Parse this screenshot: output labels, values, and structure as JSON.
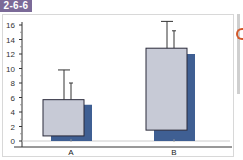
{
  "figure_label": "2-6-6",
  "colors": {
    "label_bg": "#7b6a98",
    "box_fill": "#c7cad6",
    "box_stroke": "#2a2a3a",
    "shadow_fill": "#3f5f93",
    "axis": "#333333",
    "baseline": "#cccccc",
    "side_glyph": "#d2582a"
  },
  "chart_data": {
    "type": "bar",
    "title": "",
    "xlabel": "",
    "ylabel": "",
    "categories": [
      "A",
      "B"
    ],
    "ylim": [
      0,
      16
    ],
    "yticks": [
      0,
      2,
      4,
      6,
      8,
      10,
      12,
      14,
      16
    ],
    "grid": false,
    "legend": null,
    "series": [
      {
        "name": "front box",
        "low": [
          0.7,
          1.5
        ],
        "high": [
          5.7,
          12.8
        ],
        "error_top": [
          9.8,
          16.5
        ]
      },
      {
        "name": "shadow bar",
        "values": [
          5.0,
          12.0
        ],
        "error_top": [
          8.0,
          15.2
        ]
      }
    ]
  }
}
